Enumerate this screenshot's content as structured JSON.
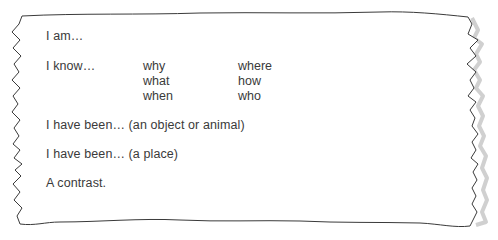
{
  "card": {
    "style": "torn-paper note",
    "border_color": "#3a3a3a",
    "shadow_color": "#bdbdbd",
    "background": "#ffffff",
    "text_color": "#3a3a3a"
  },
  "lines": {
    "i_am": "I am…",
    "i_know": "I know…",
    "object_or_animal": "I have been… (an object or animal)",
    "place": "I have been… (a place)",
    "contrast": "A contrast."
  },
  "question_words": {
    "column1": [
      "why",
      "what",
      "when"
    ],
    "column2": [
      "where",
      "how",
      "who"
    ]
  }
}
